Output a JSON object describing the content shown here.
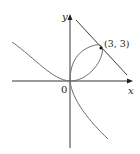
{
  "figure": {
    "type": "folium of Descartes with tangent line",
    "axis_labels": {
      "x": "x",
      "y": "y"
    },
    "origin_label": "0",
    "point_label": "(3, 3)",
    "point": [
      3,
      3
    ],
    "colors": {
      "curve": "#6d6e71",
      "axes": "#231f20",
      "tangent": "#414042"
    }
  }
}
